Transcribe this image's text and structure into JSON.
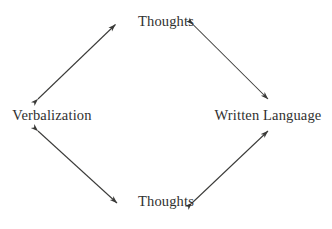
{
  "diagram": {
    "shape": "diamond",
    "background_color": "#ffffff",
    "stroke_color": "#3a3a38",
    "text_color": "#30302f",
    "nodes": [
      {
        "id": "top",
        "label": "Thoughts",
        "position": "top"
      },
      {
        "id": "left",
        "label": "Verbalization",
        "position": "left"
      },
      {
        "id": "right",
        "label": "Written Language",
        "position": "right"
      },
      {
        "id": "bottom",
        "label": "Thoughts",
        "position": "bottom"
      }
    ],
    "edges": [
      {
        "id": "edge-left-top",
        "from": "Verbalization",
        "to": "Thoughts",
        "arrow": "double"
      },
      {
        "id": "edge-top-right",
        "from": "Thoughts",
        "to": "Written Language",
        "arrow": "double"
      },
      {
        "id": "edge-left-bottom",
        "from": "Verbalization",
        "to": "Thoughts",
        "arrow": "double"
      },
      {
        "id": "edge-bottom-right",
        "from": "Thoughts",
        "to": "Written Language",
        "arrow": "double"
      }
    ]
  }
}
